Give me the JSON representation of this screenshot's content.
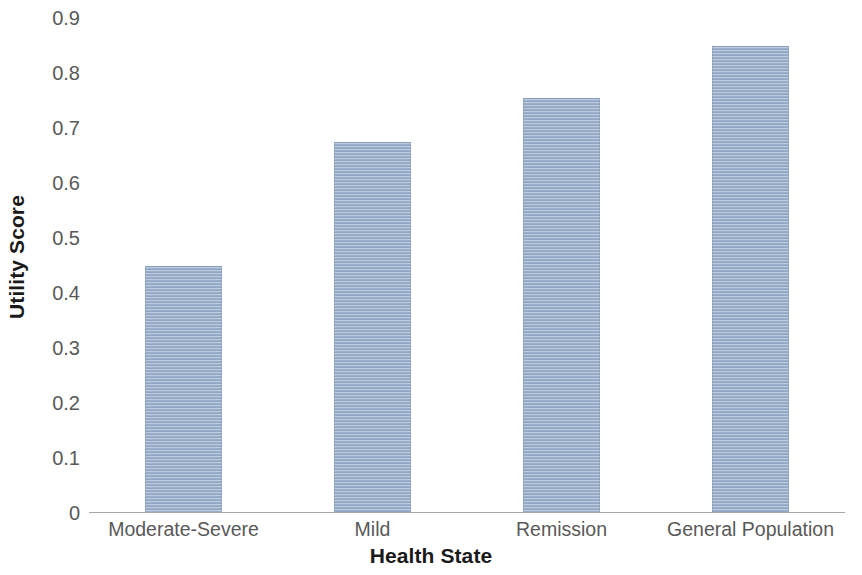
{
  "chart_data": {
    "type": "bar",
    "title": "",
    "subtitle": "",
    "xlabel": "Health State",
    "ylabel": "Utility Score",
    "categories": [
      "Moderate-Severe",
      "Mild",
      "Remission",
      "General Population"
    ],
    "values": [
      0.45,
      0.675,
      0.755,
      0.85
    ],
    "series": [
      {
        "name": "Utility Score",
        "values": [
          0.45,
          0.675,
          0.755,
          0.85
        ]
      }
    ],
    "ylim": [
      0,
      0.9
    ],
    "xlim": [
      0,
      4
    ],
    "y_ticks": [
      0,
      0.1,
      0.2,
      0.3,
      0.4,
      0.5,
      0.6,
      0.7,
      0.8,
      0.9
    ],
    "y_tick_labels": [
      "0",
      "0.1",
      "0.2",
      "0.3",
      "0.4",
      "0.5",
      "0.6",
      "0.7",
      "0.8",
      "0.9"
    ],
    "grid": false,
    "legend": "none",
    "bar_color": "#8fa6c4",
    "bar_pattern": "horizontal-stripes",
    "axis_color": "#a6a6a6",
    "tick_label_color": "#595959",
    "axis_title_color": "#1a1a1a",
    "background_color": "#ffffff",
    "annotations": []
  }
}
